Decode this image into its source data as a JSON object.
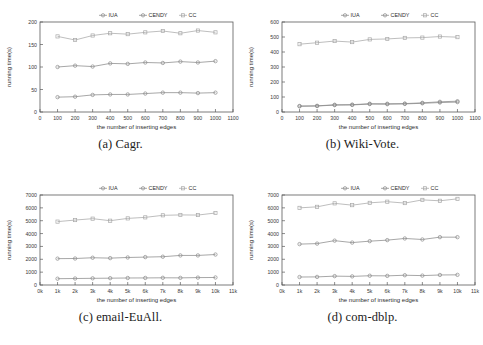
{
  "figure": {
    "legend_labels": [
      "IUA",
      "CENDY",
      "CC"
    ],
    "series_colors": {
      "IUA": "#8a8a8a",
      "CENDY": "#8a8a8a",
      "CC": "#a8a8a8"
    },
    "axis_label_x": "the number of inserting edges",
    "axis_label_y": "running time(s)"
  },
  "captions": {
    "a": "(a) Cagr.",
    "b": "(b) Wiki-Vote.",
    "c": "(c) email-EuAll.",
    "d": "(d) com-dblp."
  },
  "chart_data": [
    {
      "id": "a",
      "type": "line",
      "title": "(a) Cagr.",
      "xlabel": "the number of inserting edges",
      "ylabel": "running time(s)",
      "x": [
        100,
        200,
        300,
        400,
        500,
        600,
        700,
        800,
        900,
        1000
      ],
      "xticks": [
        0,
        100,
        200,
        300,
        400,
        500,
        600,
        700,
        800,
        900,
        1000,
        1100
      ],
      "xticklabels": [
        "0",
        "100",
        "200",
        "300",
        "400",
        "500",
        "600",
        "700",
        "800",
        "900",
        "1000",
        "1100"
      ],
      "yticks": [
        0,
        50,
        100,
        150,
        200
      ],
      "yticklabels": [
        "0",
        "50",
        "100",
        "150",
        "200"
      ],
      "xlim": [
        0,
        1100
      ],
      "ylim": [
        0,
        200
      ],
      "grid": false,
      "legend_position": "top-center-outside",
      "series": [
        {
          "name": "IUA",
          "marker": "circle",
          "values": [
            33,
            34,
            38,
            39,
            39,
            41,
            43,
            43,
            42,
            43
          ]
        },
        {
          "name": "CENDY",
          "marker": "circle",
          "values": [
            100,
            103,
            101,
            108,
            107,
            110,
            109,
            112,
            110,
            113
          ]
        },
        {
          "name": "CC",
          "marker": "square",
          "values": [
            168,
            160,
            170,
            175,
            173,
            177,
            180,
            175,
            181,
            177
          ]
        }
      ]
    },
    {
      "id": "b",
      "type": "line",
      "title": "(b) Wiki-Vote.",
      "xlabel": "the number of inserting edges",
      "ylabel": "running time(s)",
      "x": [
        100,
        200,
        300,
        400,
        500,
        600,
        700,
        800,
        900,
        1000
      ],
      "xticks": [
        0,
        100,
        200,
        300,
        400,
        500,
        600,
        700,
        800,
        900,
        1000,
        1100
      ],
      "xticklabels": [
        "0",
        "100",
        "200",
        "300",
        "400",
        "500",
        "600",
        "700",
        "800",
        "900",
        "1000",
        "1100"
      ],
      "yticks": [
        0,
        100,
        200,
        300,
        400,
        500,
        600
      ],
      "yticklabels": [
        "0",
        "100",
        "200",
        "300",
        "400",
        "500",
        "600"
      ],
      "xlim": [
        0,
        1100
      ],
      "ylim": [
        0,
        600
      ],
      "grid": false,
      "legend_position": "top-center-outside",
      "series": [
        {
          "name": "IUA",
          "marker": "circle",
          "values": [
            40,
            41,
            48,
            49,
            55,
            55,
            56,
            61,
            68,
            72
          ]
        },
        {
          "name": "CENDY",
          "marker": "circle",
          "values": [
            38,
            40,
            46,
            47,
            53,
            52,
            54,
            58,
            63,
            66
          ]
        },
        {
          "name": "CC",
          "marker": "square",
          "values": [
            452,
            462,
            473,
            466,
            484,
            487,
            494,
            496,
            503,
            499
          ]
        }
      ]
    },
    {
      "id": "c",
      "type": "line",
      "title": "(c) email-EuAll.",
      "xlabel": "the number of inserting edges",
      "ylabel": "running time(s)",
      "x": [
        1000,
        2000,
        3000,
        4000,
        5000,
        6000,
        7000,
        8000,
        9000,
        10000
      ],
      "xticks": [
        0,
        1000,
        2000,
        3000,
        4000,
        5000,
        6000,
        7000,
        8000,
        9000,
        10000,
        11000
      ],
      "xticklabels": [
        "0k",
        "1k",
        "2k",
        "3k",
        "4k",
        "5k",
        "6k",
        "7k",
        "8k",
        "9k",
        "10k",
        "11k"
      ],
      "yticks": [
        0,
        1000,
        2000,
        3000,
        4000,
        5000,
        6000,
        7000
      ],
      "yticklabels": [
        "0",
        "1000",
        "2000",
        "3000",
        "4000",
        "5000",
        "6000",
        "7000"
      ],
      "xlim": [
        0,
        11000
      ],
      "ylim": [
        0,
        7000
      ],
      "grid": false,
      "legend_position": "top-center-outside",
      "series": [
        {
          "name": "IUA",
          "marker": "circle",
          "values": [
            490,
            505,
            520,
            530,
            545,
            550,
            560,
            555,
            575,
            585
          ]
        },
        {
          "name": "CENDY",
          "marker": "circle",
          "values": [
            2050,
            2060,
            2120,
            2090,
            2140,
            2170,
            2200,
            2300,
            2300,
            2370
          ]
        },
        {
          "name": "CC",
          "marker": "square",
          "values": [
            4930,
            5050,
            5160,
            5000,
            5180,
            5260,
            5420,
            5450,
            5440,
            5600
          ]
        }
      ]
    },
    {
      "id": "d",
      "type": "line",
      "title": "(d) com-dblp.",
      "xlabel": "the number of inserting edges",
      "ylabel": "running time(s)",
      "x": [
        1000,
        2000,
        3000,
        4000,
        5000,
        6000,
        7000,
        8000,
        9000,
        10000
      ],
      "xticks": [
        0,
        1000,
        2000,
        3000,
        4000,
        5000,
        6000,
        7000,
        8000,
        9000,
        10000,
        11000
      ],
      "xticklabels": [
        "0k",
        "1k",
        "2k",
        "3k",
        "4k",
        "5k",
        "6k",
        "7k",
        "8k",
        "9k",
        "10k",
        "11k"
      ],
      "yticks": [
        0,
        1000,
        2000,
        3000,
        4000,
        5000,
        6000,
        7000
      ],
      "yticklabels": [
        "0",
        "1000",
        "2000",
        "3000",
        "4000",
        "5000",
        "6000",
        "7000"
      ],
      "xlim": [
        0,
        11000
      ],
      "ylim": [
        0,
        7000
      ],
      "grid": false,
      "legend_position": "top-center-outside",
      "series": [
        {
          "name": "IUA",
          "marker": "circle",
          "values": [
            620,
            630,
            690,
            670,
            720,
            710,
            760,
            730,
            780,
            790
          ]
        },
        {
          "name": "CENDY",
          "marker": "circle",
          "values": [
            3180,
            3220,
            3450,
            3300,
            3410,
            3490,
            3620,
            3540,
            3720,
            3720
          ]
        },
        {
          "name": "CC",
          "marker": "square",
          "values": [
            6000,
            6080,
            6350,
            6210,
            6390,
            6480,
            6370,
            6620,
            6550,
            6700
          ]
        }
      ]
    }
  ]
}
